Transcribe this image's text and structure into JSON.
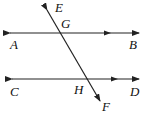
{
  "diagram": {
    "type": "parallel lines cut by a transversal",
    "lines": [
      {
        "name": "AB",
        "endpoints": [
          "A",
          "B"
        ],
        "parallel_mark": true
      },
      {
        "name": "CD",
        "endpoints": [
          "C",
          "D"
        ],
        "parallel_mark": true
      },
      {
        "name": "EF",
        "endpoints": [
          "E",
          "F"
        ],
        "role": "transversal"
      }
    ],
    "intersections": [
      {
        "point": "G",
        "lines": [
          "AB",
          "EF"
        ]
      },
      {
        "point": "H",
        "lines": [
          "CD",
          "EF"
        ]
      }
    ],
    "labels": {
      "A": "A",
      "B": "B",
      "C": "C",
      "D": "D",
      "E": "E",
      "F": "F",
      "G": "G",
      "H": "H"
    },
    "colors": {
      "line": "#222222",
      "background": "#ffffff"
    }
  }
}
